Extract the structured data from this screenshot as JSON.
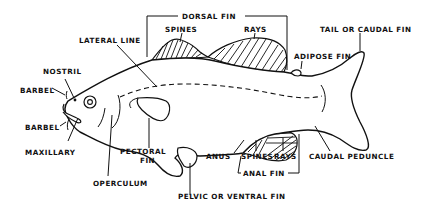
{
  "diagram": {
    "labels": {
      "dorsal_fin": "DORSAL FIN",
      "dorsal_spines": "SPINES",
      "dorsal_rays": "RAYS",
      "lateral_line": "LATERAL LINE",
      "adipose_fin": "ADIPOSE FIN",
      "tail": "TAIL OR CAUDAL FIN",
      "nostril": "NOSTRIL",
      "barbel_upper": "BARBEL",
      "barbel_lower": "BARBEL",
      "maxillary": "MAXILLARY",
      "pectoral_fin_line1": "PECTORAL",
      "pectoral_fin_line2": "FIN",
      "operculum": "OPERCULUM",
      "anus": "ANUS",
      "anal_spines": "SPINES",
      "anal_rays": "RAYS",
      "anal_fin": "ANAL FIN",
      "caudal_peduncle": "CAUDAL PEDUNCLE",
      "pelvic_fin": "PELVIC OR VENTRAL FIN"
    },
    "colors": {
      "ink": "#111111",
      "background": "#ffffff"
    }
  }
}
